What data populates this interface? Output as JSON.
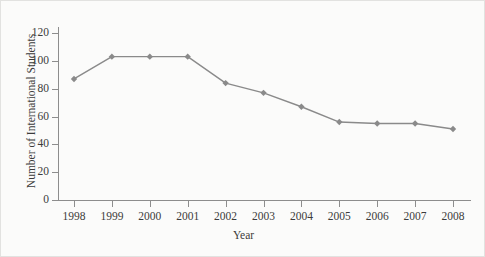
{
  "chart_data": {
    "type": "line",
    "title": "",
    "xlabel": "Year",
    "ylabel": "Number of International Students",
    "categories": [
      "1998",
      "1999",
      "2000",
      "2001",
      "2002",
      "2003",
      "2004",
      "2005",
      "2006",
      "2007",
      "2008"
    ],
    "x": [
      1998,
      1999,
      2000,
      2001,
      2002,
      2003,
      2004,
      2005,
      2006,
      2007,
      2008
    ],
    "values": [
      87,
      103,
      103,
      103,
      84,
      77,
      67,
      56,
      55,
      55,
      51
    ],
    "series": [
      {
        "name": "Number of International Students",
        "values": [
          87,
          103,
          103,
          103,
          84,
          77,
          67,
          56,
          55,
          55,
          51
        ]
      }
    ],
    "ylim": [
      0,
      120
    ],
    "yticks": [
      0,
      20,
      40,
      60,
      80,
      100,
      120
    ],
    "ytick_labels": [
      "0",
      "20",
      "40",
      "60",
      "80",
      "100",
      "120"
    ],
    "xtick_labels": [
      "1998",
      "1999",
      "2000",
      "2001",
      "2002",
      "2003",
      "2004",
      "2005",
      "2006",
      "2007",
      "2008"
    ],
    "grid": false,
    "legend": false,
    "legend_position": "none",
    "marker": "diamond",
    "line_color": "#8a8a8a",
    "marker_color": "#8a8a8a",
    "background_color": "#fbfbfa",
    "axis_color": "#8d8d8d",
    "text_color": "#3b3b3b"
  }
}
